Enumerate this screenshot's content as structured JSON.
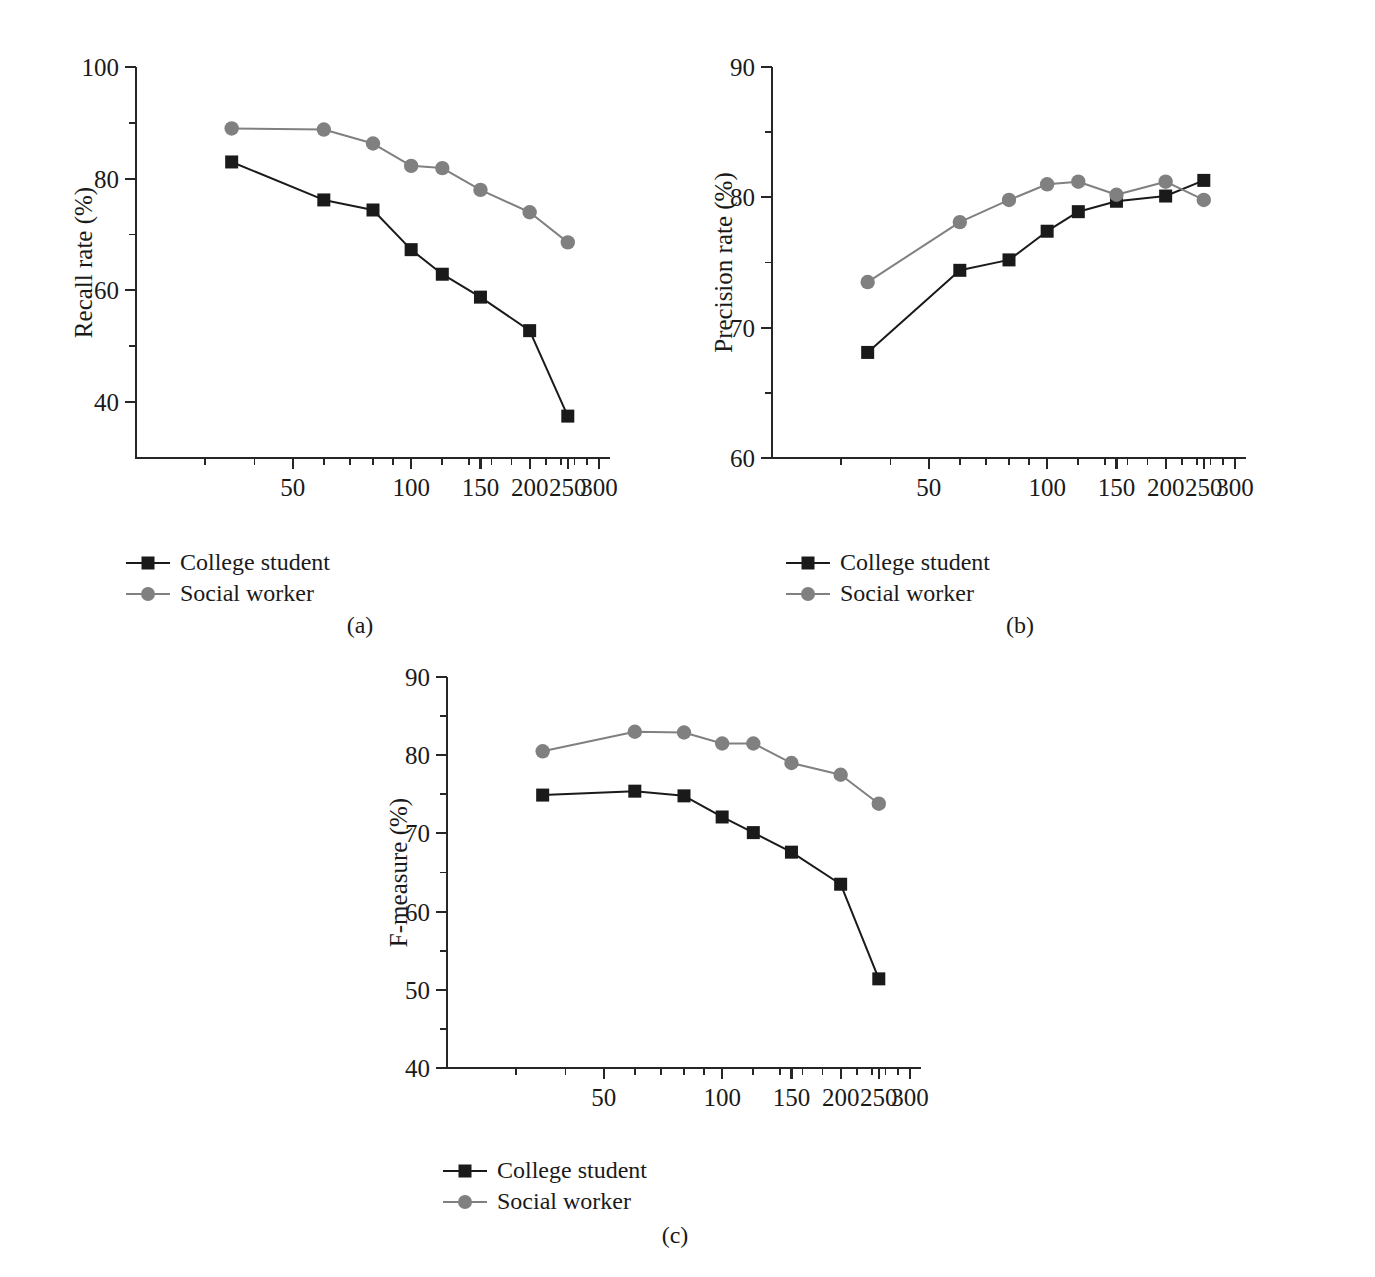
{
  "figure": {
    "background": "#ffffff",
    "series_colors": {
      "college_student": "#1a1a1a",
      "social_worker": "#808080"
    },
    "legend_items": [
      {
        "label": "College student",
        "marker": "square-marker",
        "color": "#1a1a1a"
      },
      {
        "label": "Social worker",
        "marker": "circle-marker",
        "color": "#808080"
      }
    ],
    "subcaptions": {
      "a": "(a)",
      "b": "(b)",
      "c": "(c)"
    }
  },
  "chart_data": [
    {
      "id": "panel-a",
      "type": "line",
      "title": "",
      "xlabel": "Distance threshold (m)",
      "ylabel": "Recall rate (%)",
      "xscale": "log",
      "xlim": [
        20,
        320
      ],
      "ylim": [
        30,
        100
      ],
      "grid": false,
      "legend_position": "below-left",
      "xticks": [
        50,
        100,
        150,
        200,
        250,
        300
      ],
      "xtick_labels": [
        "50",
        "100",
        "150",
        "200",
        "250",
        "300"
      ],
      "xminor_ticks": [
        30,
        40,
        60,
        70,
        80,
        90,
        120,
        140,
        160,
        180,
        220,
        240,
        260,
        280
      ],
      "yticks": [
        40,
        60,
        80,
        100
      ],
      "ytick_labels": [
        "40",
        "60",
        "80",
        "100"
      ],
      "yminor_ticks": [
        50,
        70,
        90
      ],
      "x": [
        35,
        60,
        80,
        100,
        120,
        150,
        200,
        250
      ],
      "series": [
        {
          "name": "College student",
          "marker": "square",
          "color": "#1a1a1a",
          "values": [
            83.0,
            76.2,
            74.4,
            67.3,
            62.9,
            58.8,
            52.8,
            37.5
          ]
        },
        {
          "name": "Social worker",
          "marker": "circle",
          "color": "#808080",
          "values": [
            89.0,
            88.8,
            86.3,
            82.3,
            81.9,
            78.0,
            74.0,
            68.6
          ]
        }
      ]
    },
    {
      "id": "panel-b",
      "type": "line",
      "title": "",
      "xlabel": "Distance threshold (m)",
      "ylabel": "Precision rate (%)",
      "xscale": "log",
      "xlim": [
        20,
        320
      ],
      "ylim": [
        60,
        90
      ],
      "grid": false,
      "legend_position": "below-left",
      "xticks": [
        50,
        100,
        150,
        200,
        250,
        300
      ],
      "xtick_labels": [
        "50",
        "100",
        "150",
        "200",
        "250",
        "300"
      ],
      "xminor_ticks": [
        30,
        40,
        60,
        70,
        80,
        90,
        120,
        140,
        160,
        180,
        220,
        240,
        260,
        280
      ],
      "yticks": [
        60,
        70,
        80,
        90
      ],
      "ytick_labels": [
        "60",
        "70",
        "80",
        "90"
      ],
      "yminor_ticks": [
        65,
        75,
        85
      ],
      "x": [
        35,
        60,
        80,
        100,
        120,
        150,
        200,
        250
      ],
      "series": [
        {
          "name": "College student",
          "marker": "square",
          "color": "#1a1a1a",
          "values": [
            68.1,
            74.4,
            75.2,
            77.4,
            78.9,
            79.7,
            80.1,
            81.3
          ]
        },
        {
          "name": "Social worker",
          "marker": "circle",
          "color": "#808080",
          "values": [
            73.5,
            78.1,
            79.8,
            81.0,
            81.2,
            80.2,
            81.2,
            79.8
          ]
        }
      ]
    },
    {
      "id": "panel-c",
      "type": "line",
      "title": "",
      "xlabel": "Distance threshold (m)",
      "ylabel": "F-measure (%)",
      "xscale": "log",
      "xlim": [
        20,
        320
      ],
      "ylim": [
        40,
        90
      ],
      "grid": false,
      "legend_position": "below-left",
      "xticks": [
        50,
        100,
        150,
        200,
        250,
        300
      ],
      "xtick_labels": [
        "50",
        "100",
        "150",
        "200",
        "250",
        "300"
      ],
      "xminor_ticks": [
        30,
        40,
        60,
        70,
        80,
        90,
        120,
        140,
        160,
        180,
        220,
        240,
        260,
        280
      ],
      "yticks": [
        40,
        50,
        60,
        70,
        80,
        90
      ],
      "ytick_labels": [
        "40",
        "50",
        "60",
        "70",
        "80",
        "90"
      ],
      "yminor_ticks": [
        45,
        55,
        65,
        75,
        85
      ],
      "x": [
        35,
        60,
        80,
        100,
        120,
        150,
        200,
        250
      ],
      "series": [
        {
          "name": "College student",
          "marker": "square",
          "color": "#1a1a1a",
          "values": [
            74.9,
            75.4,
            74.8,
            72.1,
            70.1,
            67.6,
            63.5,
            51.4
          ]
        },
        {
          "name": "Social worker",
          "marker": "circle",
          "color": "#808080",
          "values": [
            80.5,
            83.0,
            82.9,
            81.5,
            81.5,
            79.0,
            77.5,
            73.8
          ]
        }
      ]
    }
  ]
}
